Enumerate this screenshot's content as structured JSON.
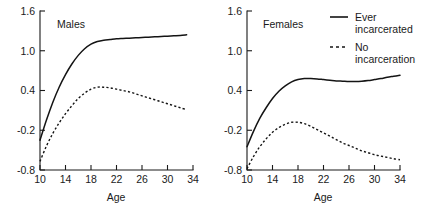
{
  "chart_data": {
    "type": "line",
    "title": "",
    "xlabel": "Age",
    "ylabel": "",
    "xlim": [
      10,
      34
    ],
    "ylim": [
      -0.8,
      1.6
    ],
    "xticks": [
      10,
      14,
      18,
      22,
      26,
      30,
      34
    ],
    "xtick_labels": [
      "10",
      "14",
      "18",
      "22",
      "26",
      "30",
      "34"
    ],
    "yticks": [
      -0.8,
      -0.2,
      0.4,
      1.0,
      1.6
    ],
    "ytick_labels": [
      "-0.8",
      "-0.2",
      "0.4",
      "1.0",
      "1.6"
    ],
    "grid": false,
    "legend_position": "top-right",
    "legend": [
      {
        "label_line1": "Ever",
        "label_line2": "incarcerated",
        "style": "solid"
      },
      {
        "label_line1": "No",
        "label_line2": "incarceration",
        "style": "dashed"
      }
    ],
    "panels": [
      {
        "name": "males-panel",
        "title": "Males",
        "x": [
          10,
          11,
          12,
          13,
          14,
          15,
          16,
          17,
          18,
          19,
          20,
          21,
          22,
          23,
          24,
          25,
          26,
          27,
          28,
          29,
          30,
          31,
          32,
          33
        ],
        "series": [
          {
            "name": "Ever incarcerated",
            "style": "solid",
            "values": [
              -0.35,
              -0.05,
              0.22,
              0.45,
              0.64,
              0.8,
              0.93,
              1.03,
              1.1,
              1.14,
              1.16,
              1.17,
              1.18,
              1.185,
              1.19,
              1.195,
              1.2,
              1.205,
              1.21,
              1.215,
              1.22,
              1.225,
              1.23,
              1.24
            ]
          },
          {
            "name": "No incarceration",
            "style": "dashed",
            "values": [
              -0.67,
              -0.44,
              -0.25,
              -0.09,
              0.05,
              0.17,
              0.28,
              0.36,
              0.42,
              0.45,
              0.45,
              0.44,
              0.42,
              0.4,
              0.38,
              0.35,
              0.32,
              0.29,
              0.26,
              0.23,
              0.2,
              0.17,
              0.14,
              0.11
            ]
          }
        ]
      },
      {
        "name": "females-panel",
        "title": "Females",
        "x": [
          10,
          11,
          12,
          13,
          14,
          15,
          16,
          17,
          18,
          19,
          20,
          21,
          22,
          23,
          24,
          25,
          26,
          27,
          28,
          29,
          30,
          31,
          32,
          33,
          34
        ],
        "series": [
          {
            "name": "Ever incarcerated",
            "style": "solid",
            "values": [
              -0.45,
              -0.22,
              -0.02,
              0.14,
              0.28,
              0.39,
              0.47,
              0.53,
              0.565,
              0.58,
              0.58,
              0.575,
              0.565,
              0.555,
              0.545,
              0.54,
              0.535,
              0.535,
              0.54,
              0.55,
              0.565,
              0.58,
              0.6,
              0.615,
              0.63
            ]
          },
          {
            "name": "No incarceration",
            "style": "dashed",
            "values": [
              -0.78,
              -0.6,
              -0.45,
              -0.33,
              -0.23,
              -0.16,
              -0.11,
              -0.08,
              -0.08,
              -0.1,
              -0.14,
              -0.19,
              -0.24,
              -0.29,
              -0.34,
              -0.39,
              -0.43,
              -0.47,
              -0.51,
              -0.54,
              -0.57,
              -0.59,
              -0.61,
              -0.63,
              -0.645
            ]
          }
        ]
      }
    ]
  }
}
